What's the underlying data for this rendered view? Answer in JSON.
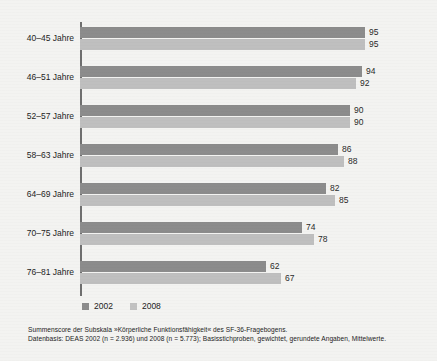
{
  "chart_data": {
    "type": "bar",
    "orientation": "horizontal",
    "title": "",
    "xlabel": "",
    "ylabel": "",
    "xlim": [
      0,
      100
    ],
    "grid": false,
    "legend_position": "bottom-left",
    "categories": [
      "40–45 Jahre",
      "46–51 Jahre",
      "52–57 Jahre",
      "58–63 Jahre",
      "64–69 Jahre",
      "70–75 Jahre",
      "76–81 Jahre"
    ],
    "series": [
      {
        "name": "2002",
        "color": "#8c8c8c",
        "values": [
          95,
          94,
          90,
          86,
          82,
          74,
          62
        ]
      },
      {
        "name": "2008",
        "color": "#bfbfbf",
        "values": [
          95,
          92,
          90,
          88,
          85,
          78,
          67
        ]
      }
    ]
  },
  "legend": {
    "items": [
      {
        "label": "2002",
        "color": "#8c8c8c"
      },
      {
        "label": "2008",
        "color": "#c2c2c2"
      }
    ]
  },
  "footnotes": [
    "Summenscore der Subskala »Körperliche Funktionsfähigkeit« des SF-36-Fragebogens.",
    "Datenbasis: DEAS 2002 (n = 2.936) und 2008 (n = 5.773); Basisstichproben, gewichtet, gerundete Angaben, Mittelwerte."
  ]
}
